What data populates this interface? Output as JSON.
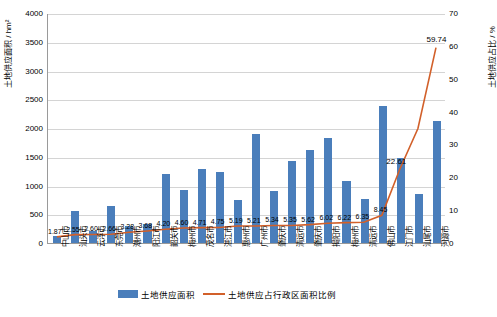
{
  "chart_data": {
    "type": "bar",
    "title": "",
    "xlabel": "",
    "ylabel": "土地供应面积 / hm²",
    "ylabel_right": "土地供应占比 / %",
    "ylim": [
      0,
      4000
    ],
    "ylim_right": [
      0,
      70
    ],
    "yticks": [
      "0",
      "500",
      "1000",
      "1500",
      "2000",
      "2500",
      "3000",
      "3500",
      "4000"
    ],
    "yticks_right": [
      "0",
      "10",
      "20",
      "30",
      "40",
      "50",
      "60",
      "70"
    ],
    "grid": true,
    "legend_position": "bottom",
    "categories": [
      "中山市",
      "汕头市",
      "云浮市",
      "东莞市",
      "潮州市",
      "阳江市",
      "韶关市",
      "梅州市",
      "茂名市",
      "湛江市",
      "惠州市",
      "广州市",
      "肇庆市",
      "清远市",
      "肇庆市",
      "揭阳市",
      "梅州市",
      "清远市",
      "佛山市",
      "江门市",
      "汕尾市",
      "河源市"
    ],
    "series": [
      {
        "name": "土地供应面积",
        "type": "bar",
        "color": "#4a7ebb",
        "values": [
          120,
          560,
          210,
          640,
          300,
          330,
          1200,
          930,
          1280,
          1230,
          740,
          1900,
          900,
          1420,
          1620,
          1830,
          1080,
          760,
          2380,
          1480,
          860,
          2120
        ]
      },
      {
        "name": "土地供应占行政区面积比例",
        "type": "line",
        "color": "#d2602a",
        "values": [
          1.87,
          2.55,
          2.6,
          2.66,
          3.28,
          3.68,
          4.2,
          4.6,
          4.71,
          4.75,
          5.19,
          5.21,
          5.34,
          5.35,
          5.62,
          6.02,
          6.22,
          6.35,
          8.45,
          22.61,
          35.0,
          59.74
        ]
      }
    ],
    "point_labels": [
      "1.87",
      "2.55",
      "2.60",
      "2.66",
      "3.28",
      "3.68",
      "4.20",
      "4.60",
      "4.71",
      "4.75",
      "5.19",
      "5.21",
      "5.34",
      "5.35",
      "5.62",
      "6.02",
      "6.22",
      "6.35",
      "8.45",
      "22.61",
      "",
      "59.74"
    ],
    "legend": [
      "土地供应面积",
      "土地供应占行政区面积比例"
    ]
  }
}
